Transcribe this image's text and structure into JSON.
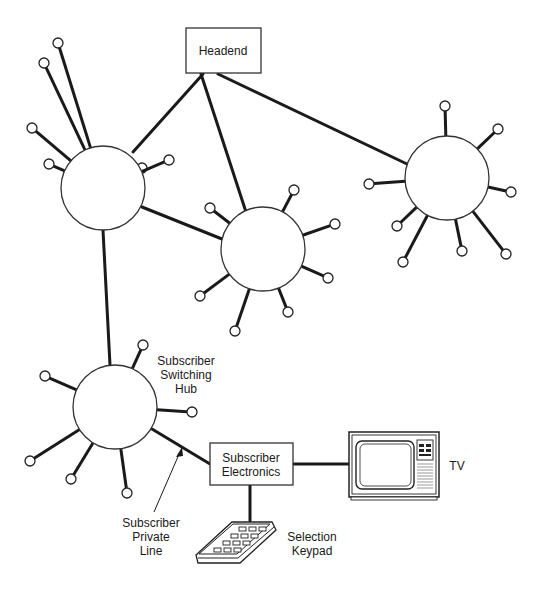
{
  "diagram": {
    "nodes": {
      "headend": {
        "label": "Headend",
        "x": 186,
        "y": 28,
        "w": 75,
        "h": 45
      },
      "subscriber_electronics": {
        "label_line1": "Subscriber",
        "label_line2": "Electronics",
        "x": 210,
        "y": 443,
        "w": 83,
        "h": 42
      },
      "tv": {
        "label": "TV"
      },
      "keypad": {
        "label_line1": "Selection",
        "label_line2": "Keypad"
      }
    },
    "hubs": [
      {
        "id": "hub-1",
        "cx": 103,
        "cy": 188,
        "r": 42,
        "spokes": [
          [
            58,
            43,
            -120
          ],
          [
            44,
            63,
            -155
          ],
          [
            32,
            128,
            165
          ],
          [
            49,
            164,
            130
          ],
          [
            142,
            168,
            55
          ],
          [
            169,
            160,
            -10
          ]
        ]
      },
      {
        "id": "hub-2",
        "cx": 263,
        "cy": 249,
        "r": 42,
        "spokes": [
          [
            210,
            208,
            -145
          ],
          [
            294,
            190,
            -60
          ],
          [
            335,
            224,
            -20
          ],
          [
            328,
            278,
            25
          ],
          [
            288,
            312,
            60
          ],
          [
            235,
            331,
            110
          ],
          [
            200,
            296,
            150
          ]
        ]
      },
      {
        "id": "hub-3",
        "cx": 447,
        "cy": 178,
        "r": 42,
        "spokes": [
          [
            445,
            106,
            -90
          ],
          [
            498,
            129,
            -40
          ],
          [
            511,
            192,
            10
          ],
          [
            506,
            254,
            50
          ],
          [
            462,
            251,
            75
          ],
          [
            397,
            226,
            135
          ],
          [
            403,
            262,
            120
          ],
          [
            369,
            184,
            180
          ]
        ]
      },
      {
        "id": "hub-4",
        "cx": 115,
        "cy": 407,
        "r": 42,
        "label_line1": "Subscriber",
        "label_line2": "Switching",
        "label_line3": "Hub",
        "spokes": [
          [
            143,
            345,
            -65
          ],
          [
            45,
            376,
            -155
          ],
          [
            192,
            412,
            0
          ],
          [
            30,
            461,
            150
          ],
          [
            71,
            479,
            120
          ],
          [
            127,
            493,
            80
          ]
        ]
      }
    ],
    "links": [
      {
        "from": "headend",
        "to": "hub-1",
        "x1": 203,
        "y1": 74,
        "x2": 133,
        "y2": 152
      },
      {
        "from": "headend",
        "to": "hub-2",
        "x1": 201,
        "y1": 74,
        "x2": 246,
        "y2": 212
      },
      {
        "from": "headend",
        "to": "hub-3",
        "x1": 218,
        "y1": 74,
        "x2": 407,
        "y2": 164
      },
      {
        "from": "hub-1",
        "to": "hub-2",
        "x1": 142,
        "y1": 207,
        "x2": 222,
        "y2": 239
      },
      {
        "from": "hub-1",
        "to": "hub-4",
        "x1": 103,
        "y1": 230,
        "x2": 110,
        "y2": 365
      },
      {
        "from": "hub-4",
        "to": "subscriber_electronics",
        "x1": 152,
        "y1": 429,
        "x2": 210,
        "y2": 464
      },
      {
        "from": "subscriber_electronics",
        "to": "tv",
        "x1": 293,
        "y1": 464,
        "x2": 350,
        "y2": 464
      },
      {
        "from": "subscriber_electronics",
        "to": "keypad",
        "x1": 250,
        "y1": 485,
        "x2": 250,
        "y2": 521
      }
    ],
    "annotations": {
      "private_line": {
        "label_line1": "Subscriber",
        "label_line2": "Private",
        "label_line3": "Line"
      }
    }
  }
}
